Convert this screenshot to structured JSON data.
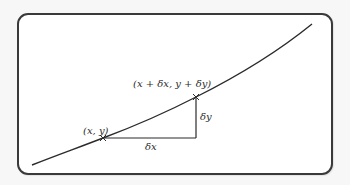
{
  "diagram": {
    "type": "curve-increment-triangle",
    "colors": {
      "background": "#f7f7f7",
      "panel": "#ffffff",
      "stroke": "#3a3a3a",
      "text": "#2b2b2b"
    },
    "labels": {
      "start_point": "(x, y)",
      "end_point": "(x + δx, y + δy)",
      "delta_x": "δx",
      "delta_y": "δy"
    },
    "geometry": {
      "curve": [
        [
          32,
          165
        ],
        [
          103,
          138
        ],
        [
          196,
          97
        ],
        [
          312,
          24
        ]
      ],
      "start": [
        103,
        138
      ],
      "end": [
        196,
        97
      ],
      "corner": [
        196,
        138
      ]
    }
  }
}
